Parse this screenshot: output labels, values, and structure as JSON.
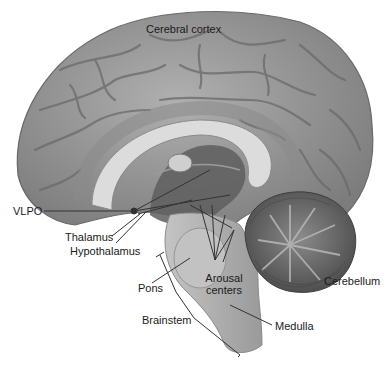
{
  "diagram": {
    "style": "grayscale anatomical illustration",
    "labels": {
      "cerebral_cortex": "Cerebral cortex",
      "vlpo": "VLPO",
      "thalamus": "Thalamus",
      "hypothalamus": "Hypothalamus",
      "pons": "Pons",
      "arousal_centers_line1": "Arousal",
      "arousal_centers_line2": "centers",
      "cerebellum": "Cerebellum",
      "brainstem": "Brainstem",
      "medulla": "Medulla"
    },
    "colors": {
      "cortex": "#9a9a9a",
      "gyri_shadow": "#6e6e6e",
      "corpus_callosum": "#d8d8d8",
      "ventricle": "#5e5e5e",
      "brainstem": "#b4b4b4",
      "cerebellum": "#6a6a6a",
      "leader_line": "#333333",
      "text": "#1a1a1a"
    }
  }
}
